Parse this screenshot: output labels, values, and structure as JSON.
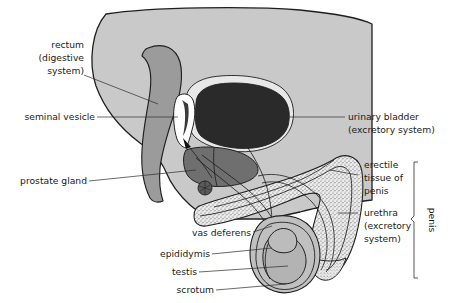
{
  "figure": {
    "background_color": "#ffffff"
  },
  "palette": {
    "body": "#c9c9c9",
    "rectum": "#9b9b9b",
    "prostate": "#6f6f6f",
    "bladder": "#2a2a2a",
    "seminal_vesicle": "#ffffff",
    "scrotum": "#c0c0c0",
    "testis": "#b3b3b3",
    "erectile_tissue": "#e3e3e3",
    "outline": "#1f1f1f",
    "leader_line": "#2b2b2b",
    "text": "#1a1a1a"
  },
  "labels": {
    "rectum": {
      "lines": [
        "rectum",
        "(digestive",
        "system)"
      ],
      "line1": "rectum",
      "line2": "(digestive",
      "line3": "system)",
      "align": "end"
    },
    "seminal_vesicle": {
      "line1": "seminal vesicle",
      "align": "end"
    },
    "prostate_gland": {
      "line1": "prostate gland",
      "align": "end"
    },
    "urinary_bladder": {
      "line1": "urinary bladder",
      "line2": "(excretory system)",
      "align": "start"
    },
    "erectile_tissue": {
      "line1": "erectile",
      "line2": "tissue of",
      "line3": "penis",
      "align": "start"
    },
    "urethra": {
      "line1": "urethra",
      "line2": "(excretory",
      "line3": "system)",
      "align": "start"
    },
    "penis_bracket": {
      "line1": "penis",
      "orientation": "vertical"
    },
    "vas_deferens": {
      "line1": "vas deferens",
      "align": "end"
    },
    "epididymis": {
      "line1": "epididymis",
      "align": "end"
    },
    "testis": {
      "line1": "testis",
      "align": "end"
    },
    "scrotum": {
      "line1": "scrotum",
      "align": "end"
    }
  }
}
